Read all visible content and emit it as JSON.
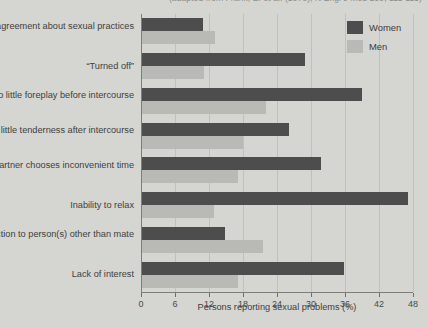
{
  "header": {
    "clipped_text": "(adapted from Frank, E. et al. (1978), N Engl J Med 299, 111-115)"
  },
  "legend": {
    "position": "top-right",
    "entries": [
      {
        "label": "Women",
        "color": "#4d4d4d"
      },
      {
        "label": "Men",
        "color": "#b9b9b5"
      }
    ]
  },
  "chart_data": {
    "type": "bar",
    "orientation": "horizontal",
    "title": "",
    "xlabel": "Persons reporting sexual problems (%)",
    "ylabel": "",
    "xlim": [
      0,
      48
    ],
    "xticks": [
      0,
      6,
      12,
      18,
      24,
      30,
      36,
      42,
      48
    ],
    "grid": true,
    "categories": [
      "Disagreement about sexual practices",
      "“Turned off”",
      "Too little foreplay before intercourse",
      "Too little tenderness after intercourse",
      "Partner chooses inconvenient time",
      "Inability to relax",
      "Attraction to person(s) other than mate",
      "Lack of interest"
    ],
    "series": [
      {
        "name": "Women",
        "color": "#4d4d4d",
        "values": [
          10.8,
          28.7,
          38.8,
          25.9,
          31.6,
          47.0,
          14.6,
          35.6
        ]
      },
      {
        "name": "Men",
        "color": "#b9b9b5",
        "values": [
          12.9,
          11.0,
          21.9,
          17.8,
          17.0,
          12.7,
          21.3,
          17.0
        ]
      }
    ]
  },
  "axis_labels": {
    "ticks": [
      "0",
      "6",
      "12",
      "18",
      "24",
      "30",
      "36",
      "42",
      "48"
    ]
  },
  "colors": {
    "background": "#d5d5d1",
    "gridline": "#c0c0bc",
    "axis": "#7d7d79",
    "text": "#414140"
  }
}
